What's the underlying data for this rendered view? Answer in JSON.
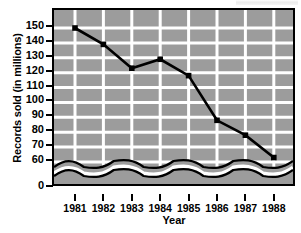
{
  "chart_data": {
    "type": "line",
    "title": "",
    "xlabel": "Year",
    "ylabel": "Records sold (in millions)",
    "categories": [
      "1981",
      "1982",
      "1983",
      "1984",
      "1985",
      "1986",
      "1987",
      "1988"
    ],
    "x": [
      1981,
      1982,
      1983,
      1984,
      1985,
      1986,
      1987,
      1988
    ],
    "values": [
      150,
      139,
      123,
      129,
      118,
      88,
      78,
      63
    ],
    "series": [
      {
        "name": "Records sold",
        "values": [
          150,
          139,
          123,
          129,
          118,
          88,
          78,
          63
        ],
        "marker": "filled-square",
        "color": "#000000"
      }
    ],
    "yticks": [
      0,
      60,
      70,
      80,
      90,
      100,
      110,
      120,
      130,
      140,
      150
    ],
    "ytick_labels": [
      "0",
      "60",
      "70",
      "80",
      "90",
      "100",
      "110",
      "120",
      "130",
      "140",
      "150"
    ],
    "ylim": [
      60,
      155
    ],
    "axis_break": {
      "present": true,
      "between": [
        0,
        60
      ],
      "style": "wavy-double-line"
    },
    "grid": true,
    "grid_color": "#ffffff",
    "plot_background": "#9c9c9c",
    "legend": "none",
    "legend_position": "none",
    "annotations": []
  },
  "axes": {
    "y_title": "Records sold (in millions)",
    "x_title": "Year"
  },
  "colors": {
    "plot_bg": "#9c9c9c",
    "grid": "#ffffff",
    "line": "#000000",
    "frame": "#000000",
    "page_bg": "#ffffff"
  }
}
